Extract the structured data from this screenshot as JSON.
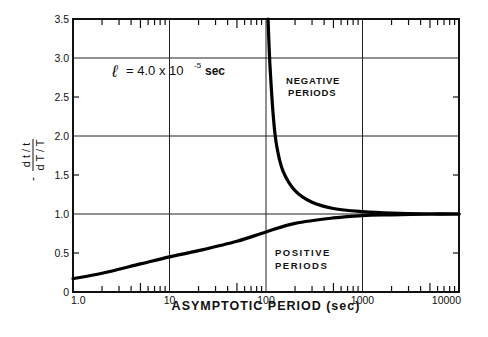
{
  "chart_data": {
    "type": "line",
    "title": "",
    "xlabel": "ASYMPTOTIC  PERIOD  (sec)",
    "ylabel": "- (dt/t) / (dT/T)",
    "ylabel_num": "d t / t",
    "ylabel_den": "d T / T",
    "ylabel_sign": "-",
    "xscale": "log",
    "xlim": [
      1,
      10000
    ],
    "ylim": [
      0,
      3.5
    ],
    "x_ticks": [
      "1.0",
      "10",
      "100",
      "1000",
      "10000"
    ],
    "y_ticks": [
      "0",
      "0.5",
      "1.0",
      "1.5",
      "2.0",
      "2.5",
      "3.0",
      "3.5"
    ],
    "grid": true,
    "annotation": "l = 4.0 x 10^-5 sec",
    "annotation_parts": {
      "symbol": "ℓ",
      "eq": "= 4.0 x 10",
      "exp": "-5",
      "unit": "sec"
    },
    "series": [
      {
        "name": "NEGATIVE PERIODS",
        "label_lines": [
          "NEGATIVE",
          "PERIODS"
        ],
        "x": [
          105,
          110,
          120,
          130,
          150,
          200,
          300,
          500,
          1000,
          2000,
          5000,
          10000
        ],
        "y": [
          3.5,
          2.9,
          2.2,
          1.85,
          1.55,
          1.3,
          1.15,
          1.07,
          1.03,
          1.01,
          1.0,
          1.0
        ]
      },
      {
        "name": "POSITIVE PERIODS",
        "label_lines": [
          "POSITIVE",
          "PERIODS"
        ],
        "x": [
          1,
          2,
          5,
          10,
          20,
          50,
          100,
          200,
          500,
          1000,
          2000,
          5000,
          10000
        ],
        "y": [
          0.17,
          0.24,
          0.36,
          0.45,
          0.53,
          0.65,
          0.77,
          0.88,
          0.95,
          0.98,
          0.99,
          1.0,
          1.0
        ]
      }
    ]
  }
}
